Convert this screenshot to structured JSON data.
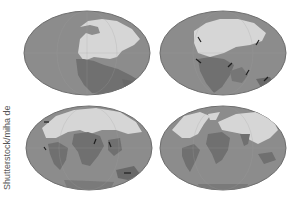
{
  "credit": "Shutterstock/miha de",
  "colors": {
    "ocean": "#8c8c8c",
    "ocean_edge": "#6f6f6f",
    "land_north": "#d6d6d6",
    "land_south": "#707070",
    "shelf": "#a8a8a8",
    "arrow": "#1e1e1e",
    "background": "#ffffff"
  },
  "maps": [
    {
      "stage": 1,
      "description": "pangaea-supercontinent",
      "position": "top-left"
    },
    {
      "stage": 2,
      "description": "early-breakup-with-arrows",
      "position": "top-right"
    },
    {
      "stage": 3,
      "description": "continents-separating-with-arrows",
      "position": "bottom-left"
    },
    {
      "stage": 4,
      "description": "modern-continents",
      "position": "bottom-right"
    }
  ]
}
